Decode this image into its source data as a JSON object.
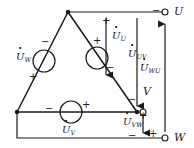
{
  "figure": {
    "type": "circuit-schematic",
    "line_color": "#1a1a1a",
    "background_color": "#ffffff"
  },
  "terminals": [
    {
      "id": "U",
      "label": "U",
      "x": 175,
      "y": 12
    },
    {
      "id": "V",
      "label": "V",
      "x": 150,
      "y": 92
    },
    {
      "id": "W",
      "label": "W",
      "x": 178,
      "y": 137
    }
  ],
  "sources": [
    {
      "id": "source-w",
      "label_base": "U",
      "label_sub": "W",
      "plus": "+",
      "minus": "−",
      "position": "left-leg"
    },
    {
      "id": "source-u",
      "label_base": "U",
      "label_sub": "U",
      "plus": "+",
      "minus": "−",
      "position": "right-leg"
    },
    {
      "id": "source-v",
      "label_base": "U",
      "label_sub": "V",
      "plus": "+",
      "minus": "−",
      "position": "bottom-leg"
    }
  ],
  "line_voltages": [
    {
      "id": "u-uv",
      "label_base": "U",
      "label_sub": "UV",
      "direction": "down"
    },
    {
      "id": "u-wu",
      "label_base": "U",
      "label_sub": "WU",
      "direction": "up"
    },
    {
      "id": "u-vw",
      "label_base": "U",
      "label_sub": "VW",
      "direction": "down"
    }
  ],
  "phase_arrow": {
    "id": "u-u",
    "label_base": "U",
    "label_sub": "U",
    "direction": "down"
  },
  "signs": {
    "left_source_minus": "−",
    "left_source_plus": "+",
    "right_source_plus": "+",
    "right_source_minus": "−",
    "bottom_source_minus": "−",
    "bottom_source_plus": "+",
    "u_arrow_plus": "+",
    "u_arrow_minus": "−",
    "u_terminal_minus": "−",
    "v_terminal_minus": "−",
    "v_terminal_plus": "+",
    "w_terminal_plus": "+",
    "w_terminal_minus": "−"
  }
}
